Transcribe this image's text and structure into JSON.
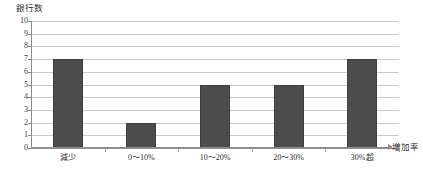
{
  "chart_data": {
    "type": "bar",
    "title": "",
    "subtitle": "",
    "categories": [
      "減少",
      "0〜10%",
      "10〜20%",
      "20〜30%",
      "30%超"
    ],
    "values": [
      7,
      2,
      5,
      5,
      7
    ],
    "series": [
      {
        "name": "銀行数",
        "values": [
          7,
          2,
          5,
          5,
          7
        ]
      }
    ],
    "xlabel": "増加率",
    "ylabel": "銀行数",
    "ylim": [
      0,
      10
    ],
    "ytick_labels": [
      "10",
      "9",
      "8",
      "7",
      "6",
      "5",
      "4",
      "3",
      "2",
      "1",
      "0"
    ],
    "ytick_values": [
      10,
      9,
      8,
      7,
      6,
      5,
      4,
      3,
      2,
      1,
      0
    ],
    "grid": true,
    "grid_axis": "y",
    "legend": false,
    "legend_position": "none",
    "bar_color": "#4c4c4c",
    "gridline_color": "#c9c9c9",
    "axis_color": "#8a8a8a",
    "x_axis_arrow": true
  },
  "axes": {
    "y_title": "銀行数",
    "x_title": "増加率"
  }
}
